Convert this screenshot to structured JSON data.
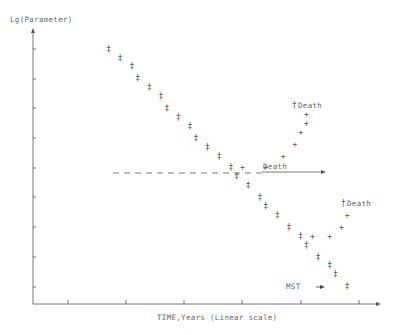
{
  "chart_data": {
    "type": "scatter",
    "title": "",
    "xlabel": "TIME,Years (Linear scale)",
    "ylabel": "Lg(Parameter)",
    "x_ticks_count": 6,
    "y_ticks_count": 9,
    "grid": false,
    "legend": null,
    "units_note": "No numeric tick labels shown; coordinates expressed in tick units (x: 0-6, y: 0-9).",
    "series": [
      {
        "name": "untreated decline",
        "marker": "‡",
        "points": [
          [
            1.3,
            8.6
          ],
          [
            1.5,
            8.3
          ],
          [
            1.7,
            8.0
          ],
          [
            1.8,
            7.6
          ],
          [
            2.0,
            7.3
          ],
          [
            2.2,
            7.0
          ],
          [
            2.3,
            6.6
          ],
          [
            2.5,
            6.3
          ],
          [
            2.7,
            6.0
          ],
          [
            2.8,
            5.6
          ],
          [
            3.0,
            5.3
          ],
          [
            3.2,
            5.0
          ],
          [
            3.4,
            4.6
          ],
          [
            3.5,
            4.3
          ],
          [
            3.7,
            4.0
          ],
          [
            3.9,
            3.6
          ],
          [
            4.0,
            3.3
          ],
          [
            4.2,
            3.0
          ],
          [
            4.4,
            2.6
          ],
          [
            4.6,
            2.3
          ],
          [
            4.7,
            2.0
          ],
          [
            4.9,
            1.6
          ],
          [
            5.1,
            1.3
          ],
          [
            5.2,
            1.0
          ],
          [
            5.4,
            0.6
          ]
        ]
      },
      {
        "name": "early treatment response",
        "marker": "+",
        "points": [
          [
            3.6,
            4.6
          ],
          [
            4.0,
            4.6
          ],
          [
            4.3,
            5.0
          ],
          [
            4.5,
            5.4
          ],
          [
            4.6,
            5.8
          ],
          [
            4.7,
            6.1
          ],
          [
            4.7,
            6.4
          ]
        ],
        "end_label": "†Death"
      },
      {
        "name": "late treatment response",
        "marker": "+",
        "points": [
          [
            4.8,
            2.3
          ],
          [
            5.1,
            2.3
          ],
          [
            5.3,
            2.6
          ],
          [
            5.4,
            3.0
          ]
        ],
        "end_label": "†Death"
      }
    ],
    "annotations": [
      {
        "text": "Death",
        "type": "arrow-right",
        "y": 4.4,
        "x_start": 3.9,
        "x_end": 5.0
      },
      {
        "text": "MST",
        "type": "arrow-right",
        "y": 0.6,
        "x": 4.6
      },
      {
        "text": "†Death",
        "x": 4.7,
        "y": 6.7
      },
      {
        "text": "†Death",
        "x": 5.4,
        "y": 3.4
      }
    ],
    "reference_line": {
      "style": "dashed",
      "y": 4.4,
      "x_start": 1.4,
      "x_end": 3.9
    }
  },
  "labels": {
    "y_axis": "Lg(Parameter)",
    "x_axis": "TIME,Years (Linear scale)",
    "death_arrow": "Death",
    "death_top": "Death",
    "death_right": "Death",
    "mst": "MST",
    "dagger": "†"
  }
}
